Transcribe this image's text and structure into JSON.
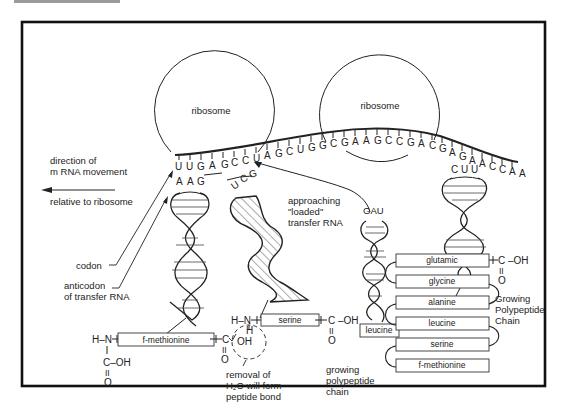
{
  "figure": {
    "frame_color": "#111111",
    "ribosomes": [
      {
        "label": "ribosome"
      },
      {
        "label": "ribosome"
      }
    ],
    "mrna": {
      "sequence": [
        "U",
        "U",
        "G",
        "A",
        "G",
        "C",
        "C",
        "U",
        "A",
        "G",
        "C",
        "U",
        "G",
        "G",
        "C",
        "G",
        "A",
        "A",
        "G",
        "C",
        "C",
        "G",
        "A",
        "C",
        "G",
        "A",
        "G",
        "A",
        "A",
        "C",
        "C",
        "A",
        "A",
        "C"
      ]
    },
    "direction": {
      "line1": "direction of",
      "line2": "m RNA movement",
      "line3": "relative to ribosome"
    },
    "labels": {
      "codon": "codon",
      "anticodon_line1": "anticodon",
      "anticodon_line2": "of transfer RNA",
      "approaching_line1": "approaching",
      "approaching_line2": "\"loaded\"",
      "approaching_line3": "transfer RNA",
      "removal_line1": "removal of",
      "removal_line2": "H₂O will form",
      "removal_line3": "peptide bond",
      "growing_line1": "growing",
      "growing_line2": "polypeptide",
      "growing_line3": "chain",
      "growing_cap_line1": "Growing",
      "growing_cap_line2": "Polypeptide",
      "growing_cap_line3": "Chain"
    },
    "trna": {
      "left_anticodon": [
        "A",
        "A",
        "G"
      ],
      "middle_anticodon": [
        "U",
        "C",
        "G"
      ],
      "approaching_anticodon": "GAU",
      "right_anticodon": [
        "C",
        "U",
        "U"
      ]
    },
    "amino_acids": {
      "left": "f-methionine",
      "middle": "serine",
      "approaching": "leucine"
    },
    "chemistry": {
      "hn": "H–N",
      "c": "C",
      "cooh": "C–OH",
      "o": "O",
      "oh": "OH",
      "h": "H",
      "coh": "C –OH",
      "dbl": "II"
    },
    "chain": [
      "glutamic",
      "glycine",
      "alanine",
      "leucine",
      "serine",
      "f-methionine"
    ]
  }
}
